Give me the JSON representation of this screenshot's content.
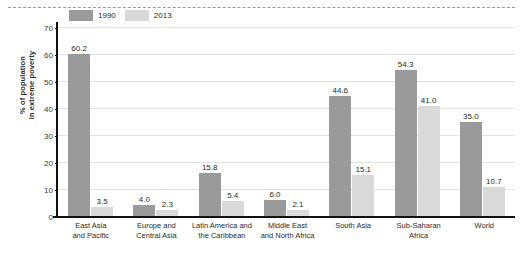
{
  "chart_data": {
    "type": "bar",
    "title": "",
    "subtitle": "",
    "xlabel": "",
    "ylabel": "% of population in extreme poverty",
    "ylabel_lines": [
      "% of population",
      "in extreme poverty"
    ],
    "ylim": [
      0,
      72
    ],
    "yticks": [
      0,
      10,
      20,
      30,
      40,
      50,
      60,
      70
    ],
    "ytick_labels": [
      "0",
      "10",
      "20",
      "30",
      "40",
      "50",
      "60",
      "70"
    ],
    "grid": true,
    "legend_position": "top-left-inside",
    "categories": [
      "East Asia and Pacific",
      "Europe and Central Asia",
      "Latin America and the Caribbean",
      "Middle East and North Africa",
      "South Asia",
      "Sub-Saharan Africa",
      "World"
    ],
    "category_lines": [
      [
        "East Asia",
        "and Pacific"
      ],
      [
        "Europe and",
        "Central Asia"
      ],
      [
        "Latin America and",
        "the Caribbean"
      ],
      [
        "Middle East",
        "and North Africa"
      ],
      [
        "South Asia",
        ""
      ],
      [
        "Sub-Saharan",
        "Africa"
      ],
      [
        "World",
        ""
      ]
    ],
    "series": [
      {
        "name": "1990",
        "color": "#9a9a9a",
        "values": [
          60.2,
          4.0,
          15.8,
          6.0,
          44.6,
          54.3,
          35.0
        ],
        "labels": [
          "60.2",
          "4.0",
          "15.8",
          "6.0",
          "44.6",
          "54.3",
          "35.0"
        ]
      },
      {
        "name": "2013",
        "color": "#d9d9d9",
        "values": [
          3.5,
          2.3,
          5.4,
          2.1,
          15.1,
          41.0,
          10.7
        ],
        "labels": [
          "3.5",
          "2.3",
          "5.4",
          "2.1",
          "15.1",
          "41.0",
          "10.7"
        ]
      }
    ]
  },
  "colors": {
    "series_1990": "#9a9a9a",
    "series_2013": "#d9d9d9",
    "axis": "#111111",
    "gridline": "#e2e2e2",
    "text": "#2b2b2b",
    "background": "#ffffff",
    "rule": "#9a9a9a"
  }
}
